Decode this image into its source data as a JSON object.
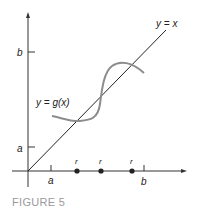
{
  "figure": {
    "caption": "FIGURE 5",
    "labels": {
      "y_tick_b": "b",
      "y_tick_a": "a",
      "x_tick_a": "a",
      "x_tick_b": "b",
      "line_label": "y = x",
      "curve_label": "y = g(x)",
      "root_labels": [
        "r",
        "r",
        "r"
      ]
    },
    "colors": {
      "axis": "#333333",
      "line": "#222222",
      "curve": "#8c8c8c",
      "caption": "#9a9a9a"
    }
  }
}
